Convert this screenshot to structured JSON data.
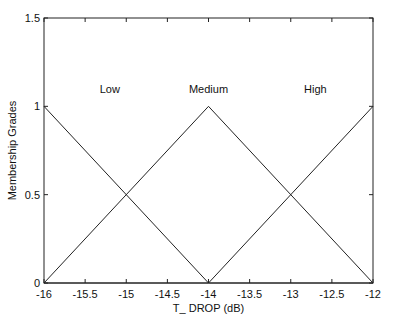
{
  "chart_data": {
    "type": "line",
    "title": "",
    "xlabel": "T_ DROP (dB)",
    "ylabel": "Membership Grades",
    "xlim": [
      -16,
      -12
    ],
    "ylim": [
      0,
      1.5
    ],
    "xticks": [
      -16,
      -15.5,
      -15,
      -14.5,
      -14,
      -13.5,
      -13,
      -12.5,
      -12
    ],
    "xtick_labels": [
      "-16",
      "-15.5",
      "-15",
      "-14.5",
      "-14",
      "-13.5",
      "-13",
      "-12.5",
      "-12"
    ],
    "yticks": [
      0,
      0.5,
      1,
      1.5
    ],
    "ytick_labels": [
      "0",
      "0.5",
      "1",
      "1.5"
    ],
    "grid": false,
    "legend": null,
    "series": [
      {
        "name": "Low",
        "x": [
          -16,
          -14,
          -12
        ],
        "y": [
          1,
          0,
          0
        ]
      },
      {
        "name": "Medium",
        "x": [
          -16,
          -14,
          -12
        ],
        "y": [
          0,
          1,
          0
        ]
      },
      {
        "name": "High",
        "x": [
          -16,
          -14,
          -12
        ],
        "y": [
          0,
          0,
          1
        ]
      }
    ],
    "annotations": [
      {
        "text": "Low",
        "x": -15.2,
        "y": 1.1
      },
      {
        "text": "Medium",
        "x": -14,
        "y": 1.1
      },
      {
        "text": "High",
        "x": -12.7,
        "y": 1.1
      }
    ],
    "line_color": "#222222"
  }
}
